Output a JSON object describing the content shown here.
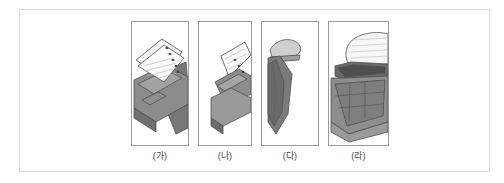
{
  "figure": {
    "frame": {
      "border_color": "#d9d9d9",
      "background": "#ffffff"
    },
    "panels": [
      {
        "id": "panel-a",
        "label": "(가)",
        "caption_text": "(가)",
        "illustration_name": "notebook-paper-over-keyboard",
        "description": "Spiral-bound lined notepad with punched holes resting on a dark tilted keyboard",
        "border_color": "#9a9a9a"
      },
      {
        "id": "panel-b",
        "label": "(나)",
        "caption_text": "(나)",
        "illustration_name": "tilted-paper-and-keyboard",
        "description": "Angled sheet of paper with holes above a tilted grey keyboard body",
        "border_color": "#9a9a9a"
      },
      {
        "id": "panel-c",
        "label": "(다)",
        "caption_text": "(다)",
        "illustration_name": "folded-dark-shape-close-up",
        "description": "Close-up of a light curved flap above a large dark folded form",
        "border_color": "#9a9a9a"
      },
      {
        "id": "panel-d",
        "label": "(라)",
        "caption_text": "(라)",
        "illustration_name": "keypad-grid-with-paper-roll",
        "description": "Large grid of square keys below a lined paper sheet curling over the top",
        "border_color": "#9a9a9a"
      }
    ],
    "palette": {
      "paper_light": "#f2f2f2",
      "paper_white": "#fbfbfb",
      "grey_mid": "#9d9d9d",
      "grey_dark": "#6e6e6e",
      "grey_darker": "#565656",
      "outline": "#4f4f4f",
      "label_text": "#4a4a4a"
    }
  }
}
